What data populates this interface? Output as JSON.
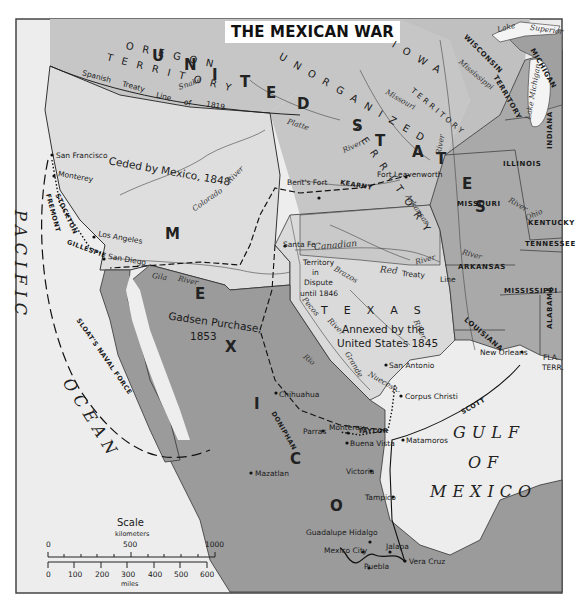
{
  "title": "THE MEXICAN WAR",
  "colors": {
    "background": "#ffffff",
    "frame": "#333333",
    "ocean": "#ececec",
    "ceded_territory": "#dcdcdc",
    "us_territory": "#c4c4c4",
    "us_states": "#a8a8a8",
    "mexico": "#9a9a9a",
    "routes": "#111111"
  },
  "regions": {
    "ceded": "Ceded by Mexico, 1848",
    "gadsen": "Gadsen Purchase,",
    "gadsen_year": "1853",
    "texas_annexed_1": "Annexed by the",
    "texas_annexed_2": "United States 1845",
    "dispute_1": "Territory",
    "dispute_2": "in",
    "dispute_3": "Dispute",
    "dispute_4": "until 1846",
    "oregon": "OREGON",
    "territory": "TERRITORY",
    "unorganized": "UNORGANIZED",
    "unorganized_territory": "TERRITORY",
    "iowa": "IOWA",
    "iowa_territory": "TERRITORY",
    "wisconsin": "WISCONSIN",
    "wisconsin_territory": "TERRITORY",
    "texas": "TEXAS",
    "fla_terr_1": "FLA.",
    "fla_terr_2": "TERR."
  },
  "big_letters": {
    "united": [
      "U",
      "N",
      "I",
      "T",
      "E",
      "D"
    ],
    "states": [
      "S",
      "T",
      "A",
      "T",
      "E",
      "S"
    ],
    "mexico": [
      "M",
      "E",
      "X",
      "I",
      "C",
      "O"
    ]
  },
  "states": [
    "ILLINOIS",
    "INDIANA",
    "MISSOURI",
    "KENTUCKY",
    "TENNESSEE",
    "ARKANSAS",
    "MISSISSIPPI",
    "ALABAMA",
    "LOUISIANA",
    "MICHIGAN"
  ],
  "lines": {
    "spanish_treaty_1": "Spanish",
    "spanish_treaty_2": "Treaty",
    "spanish_treaty_3": "Line",
    "spanish_treaty_4": "of",
    "spanish_treaty_5": "1819"
  },
  "rivers": {
    "snake": "Snake",
    "platte": "Platte",
    "platte_river": "River",
    "missouri": "Missouri",
    "missouri_river": "River",
    "mississippi": "Mississippi",
    "colorado": "Colorado",
    "colorado_river": "River",
    "gila": "Gila",
    "gila_river": "River",
    "arkansas": "Arkansas",
    "arkansas_river": "River",
    "canadian": "Canadian",
    "red": "Red",
    "brazos": "Brazos",
    "pecos": "Pecos",
    "pecos_river": "River",
    "colorado_tx_river": "River",
    "rio": "Rio",
    "grande": "Grande",
    "nueces": "Nueces",
    "nueces_r": "R.",
    "ohio": "Ohio",
    "ohio_river": "River",
    "miss_river": "River",
    "red_treaty": "Treaty",
    "red_line": "Line"
  },
  "lakes": {
    "lake": "Lake",
    "superior": "Superior",
    "michigan_lake": "Lake Michigan"
  },
  "cities": [
    {
      "name": "San Francisco"
    },
    {
      "name": "Monterey"
    },
    {
      "name": "Los Angeles"
    },
    {
      "name": "San Diego"
    },
    {
      "name": "Bent's Fort"
    },
    {
      "name": "Fort Leavenworth"
    },
    {
      "name": "Santa Fe"
    },
    {
      "name": "San Antonio"
    },
    {
      "name": "Corpus Christi"
    },
    {
      "name": "New Orleans"
    },
    {
      "name": "Chihuahua"
    },
    {
      "name": "Monterey"
    },
    {
      "name": "Buena Vista"
    },
    {
      "name": "Matamoros"
    },
    {
      "name": "Victoria"
    },
    {
      "name": "Tampico"
    },
    {
      "name": "Mazatlan"
    },
    {
      "name": "Guadalupe Hidalgo"
    },
    {
      "name": "Mexico City"
    },
    {
      "name": "Jalapa"
    },
    {
      "name": "Puebla"
    },
    {
      "name": "Vera Cruz"
    },
    {
      "name": "Parras"
    }
  ],
  "routes": {
    "kearny": "KEARNY",
    "stockton": "STOCKTON",
    "fremont": "FREMONT",
    "gillespie": "GILLESPIE",
    "sloat": "SLOAT'S NAVAL FORCE",
    "doniphan": "DONIPHAN",
    "scott": "SCOTT",
    "taylor": "TAYLOR"
  },
  "water": {
    "pacific": "PACIFIC",
    "ocean": "OCEAN",
    "gulf": "GULF",
    "of": "OF",
    "mexico": "MEXICO"
  },
  "scale": {
    "title": "Scale",
    "km_label": "kilometers",
    "km_ticks": [
      "0",
      "500",
      "1000"
    ],
    "mi_label": "miles",
    "mi_ticks": [
      "0",
      "100",
      "200",
      "300",
      "400",
      "500",
      "600"
    ]
  }
}
